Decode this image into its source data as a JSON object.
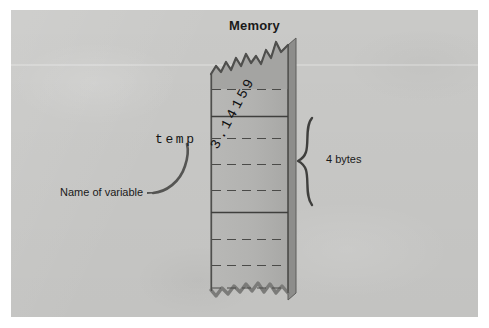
{
  "figure": {
    "title": "Memory",
    "background_color": "#c9c9c7",
    "ink_color": "#1a1a1a"
  },
  "diagram": {
    "memory_column": {
      "label": "Memory",
      "fill_color": "#b4b4b2",
      "stroke_color": "#4a4a4a",
      "top_edge": "torn-jagged",
      "bottom_edge": "torn-jagged"
    },
    "variable": {
      "name": "temp",
      "name_caption": "Name of variable",
      "stored_value": "3.14159",
      "size_label": "4 bytes"
    }
  },
  "annotations": [
    {
      "id": "memory-title",
      "text": "Memory",
      "kind": "title"
    },
    {
      "id": "temp-label",
      "text": "temp",
      "kind": "code-identifier"
    },
    {
      "id": "name-of-variable",
      "text": "Name of variable",
      "kind": "caption"
    },
    {
      "id": "value-label",
      "text": "3.14159",
      "kind": "stored-value"
    },
    {
      "id": "bytes-label",
      "text": "4 bytes",
      "kind": "size-caption"
    }
  ],
  "icons": {
    "pointer_curve": "curved-leader-line-icon",
    "size_brace": "curly-brace-icon"
  }
}
